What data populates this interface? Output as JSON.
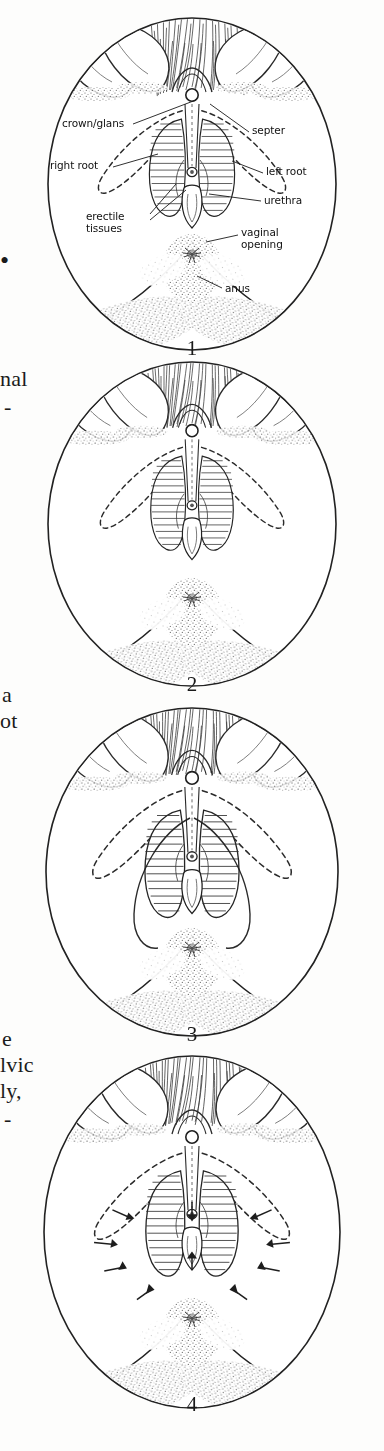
{
  "page": {
    "background_color": "#fdfdfc",
    "ink_color": "#1a1a1a",
    "width": 384,
    "height": 1451,
    "kind": "scanned-book-figure-page"
  },
  "margin_text": {
    "description": "Fragments of serif body text bleeding in from the facing page's right column, clipped at the left edge of the crop.",
    "fragments": [
      {
        "text": "•",
        "x": 0,
        "y": 258
      },
      {
        "text": "nal",
        "x": 0,
        "y": 378
      },
      {
        "text": "-",
        "x": 0,
        "y": 404
      },
      {
        "text": "a",
        "x": 0,
        "y": 694
      },
      {
        "text": "ot",
        "x": 0,
        "y": 720
      },
      {
        "text": "e",
        "x": 0,
        "y": 1038
      },
      {
        "text": "lvic",
        "x": 0,
        "y": 1064
      },
      {
        "text": "ly,",
        "x": 0,
        "y": 1090
      },
      {
        "text": "-",
        "x": 0,
        "y": 1118
      }
    ]
  },
  "figures": [
    {
      "number": "1",
      "caption_number": "1",
      "title": "Labelled vulva / clitoral anatomy, flaccid state",
      "labelled": true,
      "arrows": false,
      "number_pos": {
        "x": 172,
        "y": 336
      }
    },
    {
      "number": "2",
      "caption_number": "2",
      "title": "Vulva / clitoral anatomy, unlabelled",
      "labelled": false,
      "arrows": false,
      "number_pos": {
        "x": 172,
        "y": 676
      }
    },
    {
      "number": "3",
      "caption_number": "3",
      "title": "Vulva / clitoral anatomy, engorged",
      "labelled": false,
      "arrows": false,
      "number_pos": {
        "x": 172,
        "y": 1022
      }
    },
    {
      "number": "4",
      "caption_number": "4",
      "title": "Vulva / clitoral anatomy with contraction arrows",
      "labelled": false,
      "arrows": true,
      "number_pos": {
        "x": 172,
        "y": 1392
      }
    }
  ],
  "callouts": [
    {
      "id": "crown-glans",
      "text": "crown/glans",
      "x": 62,
      "y": 115,
      "align": "left",
      "leader": [
        [
          133,
          118
        ],
        [
          196,
          96
        ]
      ]
    },
    {
      "id": "septer",
      "text": "septer",
      "x": 252,
      "y": 122,
      "align": "left",
      "leader": [
        [
          249,
          126
        ],
        [
          209,
          98
        ]
      ]
    },
    {
      "id": "right-root",
      "text": "right root",
      "x": 52,
      "y": 155,
      "align": "left",
      "leader": [
        [
          113,
          160
        ],
        [
          155,
          146
        ]
      ]
    },
    {
      "id": "left-root",
      "text": "left root",
      "x": 266,
      "y": 162,
      "align": "left",
      "leader": [
        [
          263,
          166
        ],
        [
          233,
          152
        ]
      ]
    },
    {
      "id": "erectile-tissues",
      "text": "erectile\ntissues",
      "x": 90,
      "y": 208,
      "align": "left",
      "leader": [
        [
          150,
          213
        ],
        [
          185,
          183
        ]
      ]
    },
    {
      "id": "urethra",
      "text": "urethra",
      "x": 264,
      "y": 190,
      "align": "left",
      "leader": [
        [
          261,
          194
        ],
        [
          208,
          186
        ]
      ]
    },
    {
      "id": "vaginal-opening",
      "text": "vaginal\nopening",
      "x": 241,
      "y": 222,
      "align": "left",
      "leader": [
        [
          238,
          228
        ],
        [
          205,
          234
        ]
      ]
    },
    {
      "id": "anus",
      "text": "anus",
      "x": 225,
      "y": 278,
      "align": "left",
      "leader": [
        [
          222,
          281
        ],
        [
          196,
          268
        ]
      ]
    }
  ]
}
